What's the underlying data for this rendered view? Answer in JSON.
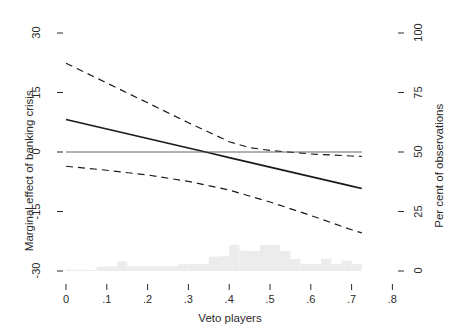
{
  "chart_data": {
    "type": "line",
    "title": "",
    "subtitle": "",
    "xlabel": "Veto players",
    "ylabel": "Marginal effect of banking crisis",
    "y2label": "Per cent of observations",
    "xlim": [
      0,
      0.8
    ],
    "ylim": [
      -30,
      30
    ],
    "y2lim": [
      0,
      100
    ],
    "grid": false,
    "legend": null,
    "xticks": [
      "0",
      ".1",
      ".2",
      ".3",
      ".4",
      ".5",
      ".6",
      ".7",
      ".8"
    ],
    "xtick_values": [
      0,
      0.1,
      0.2,
      0.3,
      0.4,
      0.5,
      0.6,
      0.7,
      0.8
    ],
    "yticks": [
      "30",
      "15",
      "0",
      "-15",
      "-30"
    ],
    "ytick_values": [
      30,
      15,
      0,
      -15,
      -30
    ],
    "y2ticks": [
      "100",
      "75",
      "50",
      "25",
      "0"
    ],
    "y2tick_values": [
      100,
      75,
      50,
      25,
      0
    ],
    "series": [
      {
        "name": "Marginal effect",
        "style": "solid",
        "color": "#1a1a1a",
        "x": [
          0.0,
          0.1,
          0.2,
          0.3,
          0.35,
          0.4,
          0.5,
          0.6,
          0.7,
          0.725
        ],
        "values": [
          8.2,
          5.8,
          3.4,
          1.0,
          -0.2,
          -1.4,
          -3.8,
          -6.2,
          -8.6,
          -9.2
        ]
      },
      {
        "name": "Upper 95% confidence bound",
        "style": "dashed",
        "color": "#1a1a1a",
        "x": [
          0.0,
          0.1,
          0.2,
          0.3,
          0.4,
          0.45,
          0.5,
          0.6,
          0.7,
          0.725
        ],
        "values": [
          22.4,
          17.4,
          12.4,
          7.4,
          2.6,
          1.1,
          0.4,
          -0.5,
          -1.0,
          -1.1
        ]
      },
      {
        "name": "Lower 95% confidence bound",
        "style": "dashed",
        "color": "#1a1a1a",
        "x": [
          0.0,
          0.1,
          0.2,
          0.3,
          0.4,
          0.5,
          0.6,
          0.7,
          0.725
        ],
        "values": [
          -3.6,
          -4.6,
          -5.8,
          -7.4,
          -9.6,
          -12.6,
          -16.0,
          -19.6,
          -20.4
        ]
      },
      {
        "name": "Zero reference line",
        "style": "solid-thin",
        "color": "#555555",
        "x": [
          0.0,
          0.725
        ],
        "values": [
          0,
          0
        ]
      }
    ],
    "histogram": {
      "name": "Distribution of observations",
      "color": "#ececec",
      "axis": "right",
      "bin_width": 0.025,
      "bins": [
        {
          "x": 0.0,
          "pct": 0.6
        },
        {
          "x": 0.025,
          "pct": 0.5
        },
        {
          "x": 0.05,
          "pct": 0.4
        },
        {
          "x": 0.075,
          "pct": 1.8
        },
        {
          "x": 0.1,
          "pct": 2.0
        },
        {
          "x": 0.125,
          "pct": 4.0
        },
        {
          "x": 0.15,
          "pct": 2.0
        },
        {
          "x": 0.175,
          "pct": 2.0
        },
        {
          "x": 0.2,
          "pct": 2.0
        },
        {
          "x": 0.225,
          "pct": 2.0
        },
        {
          "x": 0.25,
          "pct": 2.0
        },
        {
          "x": 0.275,
          "pct": 2.8
        },
        {
          "x": 0.3,
          "pct": 3.0
        },
        {
          "x": 0.325,
          "pct": 3.0
        },
        {
          "x": 0.35,
          "pct": 6.0
        },
        {
          "x": 0.375,
          "pct": 6.2
        },
        {
          "x": 0.4,
          "pct": 11.0
        },
        {
          "x": 0.425,
          "pct": 8.6
        },
        {
          "x": 0.45,
          "pct": 8.4
        },
        {
          "x": 0.475,
          "pct": 11.0
        },
        {
          "x": 0.5,
          "pct": 11.0
        },
        {
          "x": 0.525,
          "pct": 8.4
        },
        {
          "x": 0.55,
          "pct": 5.0
        },
        {
          "x": 0.575,
          "pct": 3.0
        },
        {
          "x": 0.6,
          "pct": 3.0
        },
        {
          "x": 0.625,
          "pct": 5.2
        },
        {
          "x": 0.65,
          "pct": 3.0
        },
        {
          "x": 0.675,
          "pct": 4.4
        },
        {
          "x": 0.7,
          "pct": 3.0
        }
      ]
    }
  },
  "axes": {
    "x_title": "Veto players",
    "y_left_title": "Marginal effect of banking crisis",
    "y_right_title": "Per cent of observations"
  },
  "ticks": {
    "y_left": [
      "30",
      "15",
      "0",
      "-15",
      "-30"
    ],
    "y_right": [
      "100",
      "75",
      "50",
      "25",
      "0"
    ],
    "x": [
      "0",
      ".1",
      ".2",
      ".3",
      ".4",
      ".5",
      ".6",
      ".7",
      ".8"
    ]
  }
}
